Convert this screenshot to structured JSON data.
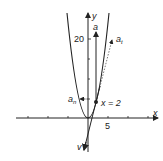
{
  "diagram": {
    "type": "parabola-acceleration-components",
    "axes": {
      "x_label": "x",
      "y_label": "y",
      "x_tick_label": "5",
      "y_tick_label": "20"
    },
    "curve": {
      "equation": "y = x^2"
    },
    "point": {
      "label": "x = 2",
      "x": 2,
      "y": 4
    },
    "vectors": {
      "a": "a",
      "a_t": {
        "base": "a",
        "sub": "t"
      },
      "a_n": {
        "base": "a",
        "sub": "n"
      },
      "v": "v"
    },
    "colors": {
      "ink": "#222222",
      "background": "#ffffff"
    }
  }
}
